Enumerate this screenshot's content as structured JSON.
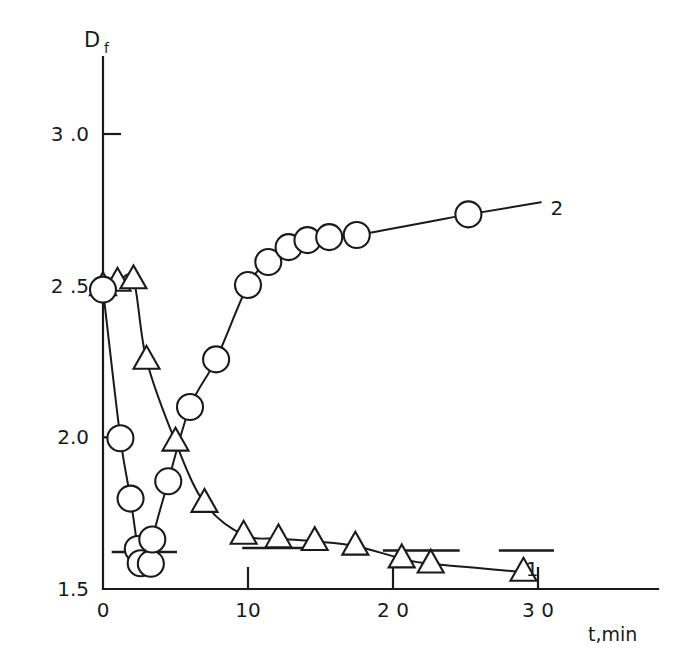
{
  "chart_data": {
    "type": "scatter",
    "title": "",
    "subtitle": "",
    "xlabel": "t,min",
    "ylabel": "D",
    "ylabel_subscript": "f",
    "xlim": [
      0,
      33.5
    ],
    "ylim": [
      1.5,
      3.12
    ],
    "grid": false,
    "legend_position": "inline-curve-end",
    "x_ticks": [
      0,
      10,
      20,
      30
    ],
    "x_tick_labels": [
      "0",
      "10",
      "2 0",
      "3 0"
    ],
    "y_ticks": [
      1.5,
      2.0,
      2.5,
      3.0
    ],
    "y_tick_labels": [
      "1.5",
      "2.0",
      "2 .5",
      "3 .0"
    ],
    "annotations": [
      {
        "name": "curve-1-label",
        "text": "1",
        "x": 29.6,
        "y": 1.565
      },
      {
        "name": "curve-2-label",
        "text": "2",
        "x": 31.3,
        "y": 2.755
      }
    ],
    "reference_lines": [
      {
        "name": "ref-dash-left",
        "y": 1.622,
        "x_start": 0.6,
        "x_end": 5.1
      },
      {
        "name": "ref-dash-mid",
        "y": 1.635,
        "x_start": 9.6,
        "x_end": 14.4
      },
      {
        "name": "ref-dash-right",
        "y": 1.627,
        "x_start": 19.3,
        "x_end": 24.6
      },
      {
        "name": "ref-dash-far-right",
        "y": 1.627,
        "x_start": 27.3,
        "x_end": 31.1
      }
    ],
    "series": [
      {
        "name": "1",
        "label": "1",
        "marker": "triangle",
        "description": "descending curve, open triangle markers",
        "points": [
          {
            "x": 0.0,
            "y": 2.497
          },
          {
            "x": 1.0,
            "y": 2.512
          },
          {
            "x": 2.1,
            "y": 2.52
          },
          {
            "x": 3.0,
            "y": 2.255
          },
          {
            "x": 5.0,
            "y": 1.985
          },
          {
            "x": 7.0,
            "y": 1.783
          },
          {
            "x": 9.7,
            "y": 1.678
          },
          {
            "x": 12.1,
            "y": 1.666
          },
          {
            "x": 14.6,
            "y": 1.657
          },
          {
            "x": 17.4,
            "y": 1.642
          },
          {
            "x": 20.6,
            "y": 1.6
          },
          {
            "x": 22.6,
            "y": 1.583
          },
          {
            "x": 29.0,
            "y": 1.556
          }
        ]
      },
      {
        "name": "2",
        "label": "2",
        "marker": "circle",
        "description": "curve dips then rises, open circle markers",
        "points": [
          {
            "x": 0.0,
            "y": 2.487
          },
          {
            "x": 1.2,
            "y": 1.997
          },
          {
            "x": 1.9,
            "y": 1.798
          },
          {
            "x": 2.4,
            "y": 1.632
          },
          {
            "x": 2.6,
            "y": 1.585
          },
          {
            "x": 3.3,
            "y": 1.583
          },
          {
            "x": 3.4,
            "y": 1.663
          },
          {
            "x": 4.5,
            "y": 1.855
          },
          {
            "x": 6.0,
            "y": 2.1
          },
          {
            "x": 7.8,
            "y": 2.257
          },
          {
            "x": 10.0,
            "y": 2.502
          },
          {
            "x": 11.4,
            "y": 2.578
          },
          {
            "x": 12.8,
            "y": 2.627
          },
          {
            "x": 14.1,
            "y": 2.65
          },
          {
            "x": 15.6,
            "y": 2.66
          },
          {
            "x": 17.5,
            "y": 2.667
          },
          {
            "x": 25.2,
            "y": 2.735
          }
        ]
      }
    ]
  },
  "figure": {
    "marker_radius_px": 13,
    "triangle_size_px": 26,
    "accent_color": "#1a1a1a",
    "background_color": "#ffffff"
  }
}
